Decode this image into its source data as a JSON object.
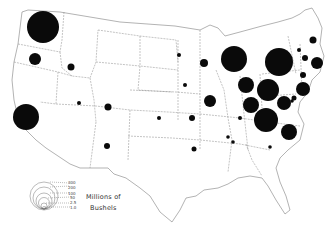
{
  "chart_data": {
    "type": "proportional-symbol-map",
    "title": "",
    "unit_label": "Millions of Bushels",
    "legend": {
      "label_line1": "Millions of",
      "label_line2": "Bushels",
      "values": [
        "300",
        "200",
        "100",
        "50",
        "2.5",
        "1.0"
      ]
    },
    "symbols": [
      {
        "region": "Washington",
        "x": 43,
        "y": 27,
        "r": 16
      },
      {
        "region": "Oregon",
        "x": 35,
        "y": 59,
        "r": 6
      },
      {
        "region": "Idaho",
        "x": 71,
        "y": 67,
        "r": 3.5
      },
      {
        "region": "California",
        "x": 26,
        "y": 117,
        "r": 13
      },
      {
        "region": "Nevada/Utah",
        "x": 79,
        "y": 103,
        "r": 2
      },
      {
        "region": "Colorado",
        "x": 108,
        "y": 107,
        "r": 3.5
      },
      {
        "region": "New Mexico",
        "x": 107,
        "y": 146,
        "r": 3
      },
      {
        "region": "North Dakota",
        "x": 179,
        "y": 55,
        "r": 2
      },
      {
        "region": "Minnesota",
        "x": 204,
        "y": 63,
        "r": 4
      },
      {
        "region": "Iowa",
        "x": 185,
        "y": 85,
        "r": 2
      },
      {
        "region": "Kansas",
        "x": 159,
        "y": 118,
        "r": 2
      },
      {
        "region": "Missouri",
        "x": 192,
        "y": 118,
        "r": 3
      },
      {
        "region": "Illinois",
        "x": 210,
        "y": 101,
        "r": 6
      },
      {
        "region": "Wisconsin/Michigan",
        "x": 234,
        "y": 59,
        "r": 13
      },
      {
        "region": "Indiana",
        "x": 246,
        "y": 85,
        "r": 8
      },
      {
        "region": "Ohio",
        "x": 251,
        "y": 105,
        "r": 8
      },
      {
        "region": "Kentucky",
        "x": 240,
        "y": 118,
        "r": 2
      },
      {
        "region": "New York",
        "x": 279,
        "y": 62,
        "r": 14
      },
      {
        "region": "Pennsylvania",
        "x": 268,
        "y": 90,
        "r": 11
      },
      {
        "region": "West Virginia/Virginia",
        "x": 266,
        "y": 120,
        "r": 12
      },
      {
        "region": "New Jersey",
        "x": 284,
        "y": 103,
        "r": 7
      },
      {
        "region": "Maryland",
        "x": 294,
        "y": 98,
        "r": 2.5
      },
      {
        "region": "North Carolina",
        "x": 289,
        "y": 132,
        "r": 8
      },
      {
        "region": "Tennessee",
        "x": 228,
        "y": 137,
        "r": 1.8
      },
      {
        "region": "Tennessee-2",
        "x": 233,
        "y": 142,
        "r": 1.8
      },
      {
        "region": "South Carolina",
        "x": 270,
        "y": 147,
        "r": 1.8
      },
      {
        "region": "Arkansas",
        "x": 194,
        "y": 149,
        "r": 2.5
      },
      {
        "region": "Vermont",
        "x": 313,
        "y": 40,
        "r": 3.5
      },
      {
        "region": "New Hampshire",
        "x": 299,
        "y": 50,
        "r": 2
      },
      {
        "region": "Massachusetts",
        "x": 305,
        "y": 58,
        "r": 3
      },
      {
        "region": "Connecticut",
        "x": 317,
        "y": 63,
        "r": 6
      },
      {
        "region": "Rhode Island",
        "x": 303,
        "y": 75,
        "r": 3
      },
      {
        "region": "Delaware",
        "x": 303,
        "y": 89,
        "r": 7
      },
      {
        "region": "Maine",
        "x": 292,
        "y": 101,
        "r": 1.8
      }
    ]
  }
}
